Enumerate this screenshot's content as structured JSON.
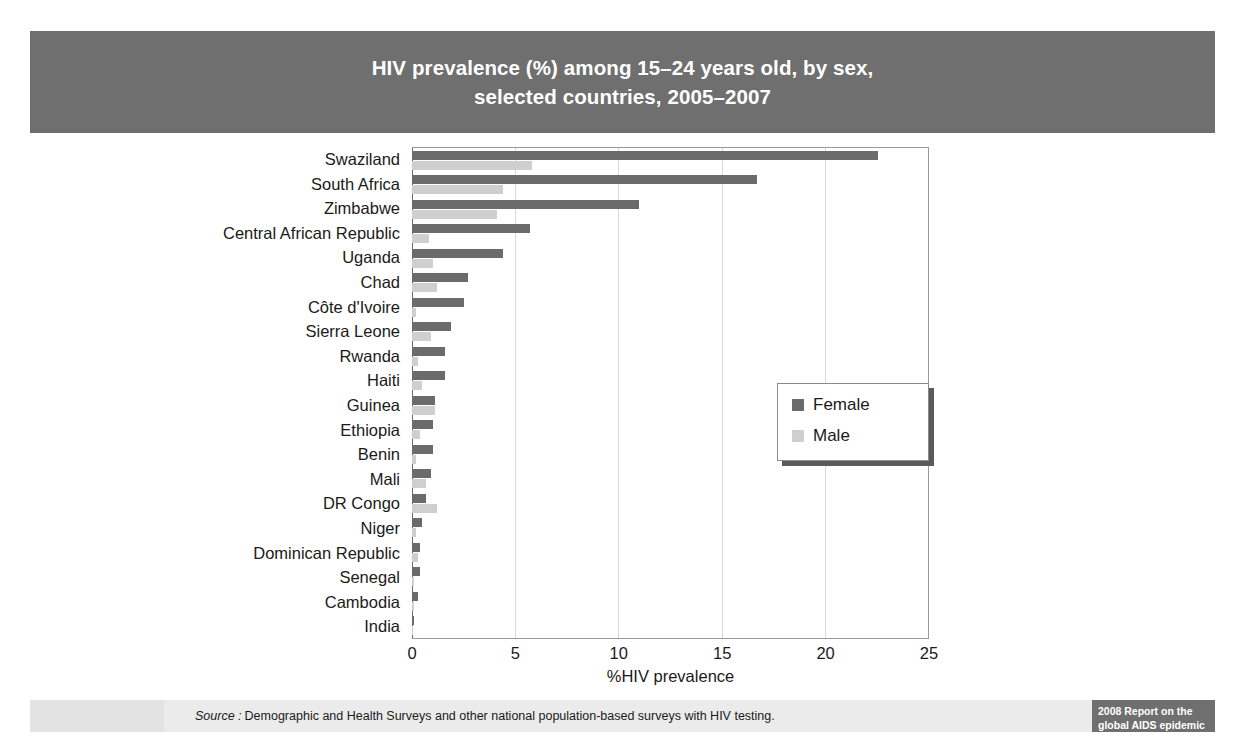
{
  "title": {
    "line1": "HIV prevalence (%) among 15–24 years old, by sex,",
    "line2": "selected countries, 2005–2007"
  },
  "footer": {
    "source_word": "Source :",
    "source_text": "Demographic and Health Surveys and other national population-based surveys with HIV testing.",
    "badge_line1": "2008 Report on the",
    "badge_line2": "global AIDS epidemic"
  },
  "colors": {
    "title_band": "#6f6f6f",
    "female": "#6b6b6b",
    "male": "#cfcfcf",
    "footer_band": "#ebebeb",
    "badge": "#6f6f6f"
  },
  "chart_data": {
    "type": "bar",
    "orientation": "horizontal",
    "title": "HIV prevalence (%) among 15–24 years old, by sex, selected countries, 2005–2007",
    "xlabel": "%HIV prevalence",
    "ylabel": "",
    "xlim": [
      0,
      25
    ],
    "xticks": [
      0,
      5,
      10,
      15,
      20,
      25
    ],
    "grid": "vertical",
    "legend_position": "inside-right",
    "categories": [
      "Swaziland",
      "South Africa",
      "Zimbabwe",
      "Central African Republic",
      "Uganda",
      "Chad",
      "Côte d'Ivoire",
      "Sierra Leone",
      "Rwanda",
      "Haiti",
      "Guinea",
      "Ethiopia",
      "Benin",
      "Mali",
      "DR Congo",
      "Niger",
      "Dominican Republic",
      "Senegal",
      "Cambodia",
      "India"
    ],
    "series": [
      {
        "name": "Female",
        "color": "#6b6b6b",
        "values": [
          22.6,
          16.7,
          11.0,
          5.7,
          4.4,
          2.7,
          2.5,
          1.9,
          1.6,
          1.6,
          1.1,
          1.0,
          1.0,
          0.9,
          0.7,
          0.5,
          0.4,
          0.4,
          0.3,
          0.1
        ]
      },
      {
        "name": "Male",
        "color": "#cfcfcf",
        "values": [
          5.8,
          4.4,
          4.1,
          0.8,
          1.0,
          1.2,
          0.2,
          0.9,
          0.3,
          0.5,
          1.1,
          0.4,
          0.2,
          0.7,
          1.2,
          0.2,
          0.3,
          0.1,
          0.1,
          0.05
        ]
      }
    ]
  }
}
